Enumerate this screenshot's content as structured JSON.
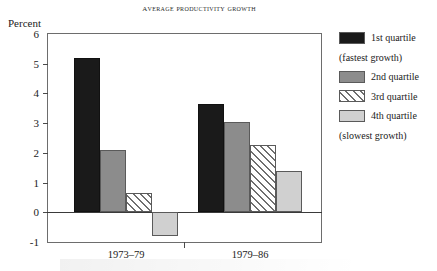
{
  "chart_data": {
    "type": "bar",
    "title": "Average productivity growth",
    "xlabel": "",
    "ylabel": "Percent",
    "ylim": [
      -1,
      6
    ],
    "yticks": [
      6,
      5,
      4,
      3,
      2,
      1,
      0,
      -1
    ],
    "ytick_labels": [
      "6",
      "5",
      "4",
      "3",
      "2",
      "1",
      "0",
      "-1"
    ],
    "grid": false,
    "legend_position": "right",
    "categories": [
      "1973–79",
      "1979–86"
    ],
    "series": [
      {
        "name": "1st quartile",
        "values": [
          5.2,
          3.65
        ]
      },
      {
        "name": "2nd quartile",
        "values": [
          2.1,
          3.05
        ]
      },
      {
        "name": "3rd quartile",
        "values": [
          0.65,
          2.25
        ]
      },
      {
        "name": "4th quartile",
        "values": [
          -0.8,
          1.4
        ]
      }
    ]
  },
  "legend": {
    "entries": [
      {
        "label": "1st quartile",
        "swatch": "solid-black",
        "color": "#1a1a1a"
      },
      {
        "label": "2nd quartile",
        "swatch": "solid-gray",
        "color": "#8c8c8c"
      },
      {
        "label": "3rd quartile",
        "swatch": "diagonal-hatch",
        "color": "#6f6f6f"
      },
      {
        "label": "4th quartile",
        "swatch": "solid-light-gray",
        "color": "#d0d0d0"
      }
    ],
    "note_fastest": "(fastest growth)",
    "note_slowest": "(slowest growth)"
  }
}
